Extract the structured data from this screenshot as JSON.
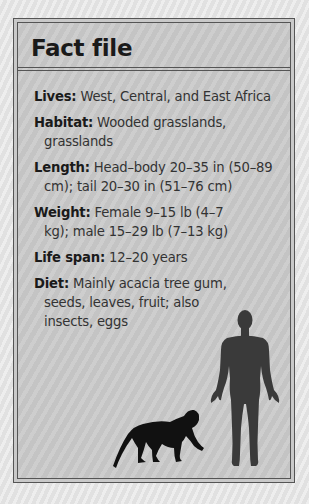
{
  "title": "Fact file",
  "entries": [
    {
      "label": "Lives:",
      "text": "West, Central, and East Africa"
    },
    {
      "label": "Habitat:",
      "text": "Wooded grasslands, grasslands"
    },
    {
      "label": "Length:",
      "text": "Head–body 20–35 in (50–89 cm); tail 20–30 in (51–76 cm)"
    },
    {
      "label": "Weight:",
      "text": "Female 9–15 lb (4–7 kg); male 15–29 lb (7–13 kg)"
    },
    {
      "label": "Life span:",
      "text": "12–20 years"
    },
    {
      "label": "Diet:",
      "text": "Mainly acacia tree gum, seeds, leaves, fruit; also insects, eggs"
    }
  ],
  "illustrations": {
    "monkey": "monkey-silhouette",
    "human": "human-silhouette"
  },
  "colors": {
    "box_background": "#c8c8c8",
    "border": "#555555",
    "text": "#333333",
    "human_silhouette": "#3a3a3a",
    "monkey_silhouette": "#111111"
  }
}
